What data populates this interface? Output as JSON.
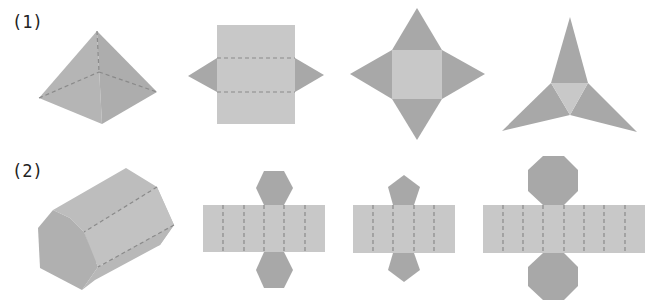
{
  "diagram": {
    "colors": {
      "face_light": "#c8c8c8",
      "face_dark": "#a8a8a8",
      "solid_face": "#b4b4b4",
      "fold_line": "#8a8a8a"
    },
    "rows": [
      {
        "label": "(1)",
        "solid": "square pyramid",
        "nets": [
          "rectangle with two triangles (triangular prism-like net)",
          "square with four triangles (square pyramid net)",
          "triangle with three triangles (triangular pyramid net)"
        ]
      },
      {
        "label": "(2)",
        "solid": "hexagonal prism",
        "nets": [
          "rectangle of 6 faces with two hexagons",
          "rectangle of 5 faces with two pentagons",
          "rectangle of 8 faces with two octagons"
        ]
      }
    ]
  }
}
